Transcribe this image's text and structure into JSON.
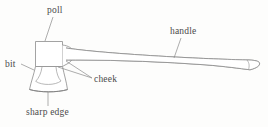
{
  "diagram": {
    "style": {
      "background_color": "#fdfdfc",
      "stroke_color": "#8c8c8c",
      "leader_color": "#8a8a8a",
      "text_color": "#4a4a4a"
    },
    "labels": [
      {
        "id": "poll",
        "text": "poll"
      },
      {
        "id": "bit",
        "text": "bit"
      },
      {
        "id": "cheek",
        "text": "cheek"
      },
      {
        "id": "sharp_edge",
        "text": "sharp edge"
      },
      {
        "id": "handle",
        "text": "handle"
      }
    ],
    "parts": [
      {
        "id": "axe-head",
        "name": "axe head"
      },
      {
        "id": "axe-handle",
        "name": "axe handle"
      }
    ]
  }
}
